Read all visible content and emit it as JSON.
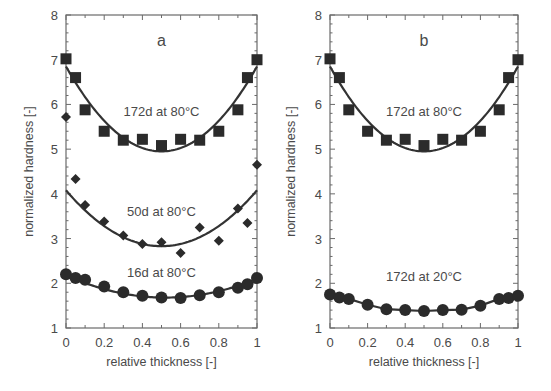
{
  "chart_data": [
    {
      "type": "scatter",
      "panel": "a",
      "title": "a",
      "xlabel": "relative thickness [-]",
      "ylabel": "normalized hardness [-]",
      "xlim": [
        0,
        1
      ],
      "ylim": [
        1,
        8
      ],
      "xticks": [
        0,
        0.2,
        0.4,
        0.6,
        0.8,
        1
      ],
      "xtick_labels": [
        "0",
        "0.2",
        "0.4",
        "0.6",
        "0.8",
        "1"
      ],
      "yticks": [
        1,
        2,
        3,
        4,
        5,
        6,
        7,
        8
      ],
      "ytick_labels": [
        "1",
        "2",
        "3",
        "4",
        "5",
        "6",
        "7",
        "8"
      ],
      "grid": false,
      "legend": "none (inline curve labels)",
      "series": [
        {
          "name": "172d at 80°C",
          "marker": "square",
          "x": [
            0,
            0.05,
            0.1,
            0.2,
            0.3,
            0.4,
            0.5,
            0.6,
            0.7,
            0.8,
            0.9,
            0.95,
            1
          ],
          "y": [
            7.02,
            6.6,
            5.88,
            5.4,
            5.2,
            5.22,
            5.08,
            5.22,
            5.2,
            5.4,
            5.88,
            6.6,
            7.0
          ],
          "fit": {
            "type": "parabola",
            "y_at_0": 6.85,
            "y_min": 4.95,
            "x_min": 0.5,
            "y_at_1": 6.85
          },
          "label_pos": {
            "x": 0.5,
            "y": 5.75
          }
        },
        {
          "name": "50d at 80°C",
          "marker": "diamond",
          "x": [
            0,
            0.05,
            0.1,
            0.2,
            0.3,
            0.4,
            0.5,
            0.6,
            0.7,
            0.8,
            0.9,
            0.95,
            1
          ],
          "y": [
            5.72,
            4.33,
            3.75,
            3.38,
            3.07,
            2.88,
            2.92,
            2.68,
            3.25,
            2.95,
            3.67,
            3.35,
            4.65
          ],
          "fit": {
            "type": "parabola",
            "y_at_0": 4.08,
            "y_min": 2.83,
            "x_min": 0.5,
            "y_at_1": 4.08
          },
          "label_pos": {
            "x": 0.5,
            "y": 3.5
          }
        },
        {
          "name": "16d at 80°C",
          "marker": "circle",
          "x": [
            0,
            0.05,
            0.1,
            0.2,
            0.3,
            0.4,
            0.5,
            0.6,
            0.7,
            0.8,
            0.9,
            0.95,
            1
          ],
          "y": [
            2.2,
            2.12,
            2.08,
            1.93,
            1.8,
            1.72,
            1.68,
            1.67,
            1.73,
            1.8,
            1.9,
            1.98,
            2.12
          ],
          "fit": {
            "type": "parabola",
            "y_at_0": 2.18,
            "y_min": 1.68,
            "x_min": 0.52,
            "y_at_1": 2.1
          },
          "label_pos": {
            "x": 0.5,
            "y": 2.15
          }
        }
      ]
    },
    {
      "type": "scatter",
      "panel": "b",
      "title": "b",
      "xlabel": "relative thickness [-]",
      "ylabel": "normalized hardness [-]",
      "xlim": [
        0,
        1
      ],
      "ylim": [
        1,
        8
      ],
      "xticks": [
        0,
        0.2,
        0.4,
        0.6,
        0.8,
        1
      ],
      "xtick_labels": [
        "0",
        "0.2",
        "0.4",
        "0.6",
        "0.8",
        "1"
      ],
      "yticks": [
        1,
        2,
        3,
        4,
        5,
        6,
        7,
        8
      ],
      "ytick_labels": [
        "1",
        "2",
        "3",
        "4",
        "5",
        "6",
        "7",
        "8"
      ],
      "grid": false,
      "legend": "none (inline curve labels)",
      "series": [
        {
          "name": "172d at 80°C",
          "marker": "square",
          "x": [
            0,
            0.05,
            0.1,
            0.2,
            0.3,
            0.4,
            0.5,
            0.6,
            0.7,
            0.8,
            0.9,
            0.95,
            1
          ],
          "y": [
            7.02,
            6.6,
            5.88,
            5.4,
            5.2,
            5.22,
            5.08,
            5.22,
            5.2,
            5.4,
            5.88,
            6.6,
            7.0
          ],
          "fit": {
            "type": "parabola",
            "y_at_0": 6.85,
            "y_min": 4.95,
            "x_min": 0.5,
            "y_at_1": 6.85
          },
          "label_pos": {
            "x": 0.5,
            "y": 5.75
          }
        },
        {
          "name": "172d at 20°C",
          "marker": "circle",
          "x": [
            0,
            0.05,
            0.1,
            0.2,
            0.3,
            0.4,
            0.5,
            0.6,
            0.7,
            0.8,
            0.9,
            0.95,
            1
          ],
          "y": [
            1.75,
            1.68,
            1.65,
            1.52,
            1.42,
            1.4,
            1.38,
            1.4,
            1.41,
            1.5,
            1.65,
            1.67,
            1.72
          ],
          "fit": {
            "type": "connected"
          },
          "label_pos": {
            "x": 0.5,
            "y": 2.05
          }
        }
      ]
    }
  ],
  "style": {
    "ink": "#333333",
    "marker": "#2b2b2b",
    "axis": "#6a6a6a",
    "text": "#4a4a4a"
  },
  "layout": {
    "panels": [
      {
        "left": 66,
        "right": 257,
        "top": 15,
        "bottom": 328,
        "ylabel_x": 33
      },
      {
        "left": 330,
        "right": 518,
        "top": 15,
        "bottom": 328,
        "ylabel_x": 295
      }
    ]
  }
}
